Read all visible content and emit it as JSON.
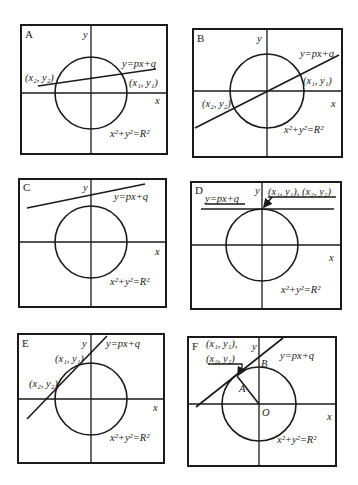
{
  "figure": {
    "panels": [
      {
        "id": "A",
        "tag": "A",
        "y_axis": "y",
        "x_axis": "x",
        "line_eq": "y=px+q",
        "circle_eq_base": "x",
        "circle_eq": "x²+y²=R²",
        "points": [
          "(x₁, y₁)",
          "(x₂, y₂)"
        ],
        "description": "Line is secant, intersects circle at two points"
      },
      {
        "id": "B",
        "tag": "B",
        "y_axis": "y",
        "x_axis": "x",
        "line_eq": "y=px+q",
        "circle_eq": "x²+y²=R²",
        "points": [
          "(x₁, y₁)",
          "(x₂, y₂)"
        ],
        "description": "Line passes through origin, intersects circle at two points"
      },
      {
        "id": "C",
        "tag": "C",
        "y_axis": "y",
        "x_axis": "x",
        "line_eq": "y=px+q",
        "circle_eq": "x²+y²=R²",
        "points": [],
        "description": "Line does not intersect circle"
      },
      {
        "id": "D",
        "tag": "D",
        "y_axis": "y",
        "x_axis": "x",
        "line_eq": "y=px+q",
        "circle_eq": "x²+y²=R²",
        "points": [
          "(x₁, y₁), (x₂, y₂)"
        ],
        "description": "Horizontal tangent line touching circle at top"
      },
      {
        "id": "E",
        "tag": "E",
        "y_axis": "y",
        "x_axis": "x",
        "line_eq": "y=px+q",
        "circle_eq": "x²+y²=R²",
        "points": [
          "(x₁, y₁)",
          "(x₂, y₂)"
        ],
        "description": "Line intersects circle at two nearby points"
      },
      {
        "id": "F",
        "tag": "F",
        "y_axis": "y",
        "x_axis": "x",
        "line_eq": "y=px+q",
        "circle_eq": "x²+y²=R²",
        "points": [
          "(x₁, y₁),",
          "(x₂, y₂)"
        ],
        "point_labels": {
          "A": "A",
          "B": "B",
          "O": "O"
        },
        "description": "Tangent line touching circle at A; OA radius perpendicular to line; B on y-axis"
      }
    ]
  }
}
